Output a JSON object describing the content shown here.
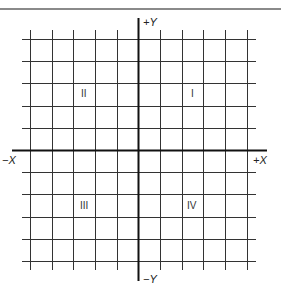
{
  "diagram": {
    "type": "cartesian-coordinate-plane",
    "axes": {
      "x_positive_label": "+X",
      "x_negative_label": "−X",
      "y_positive_label": "+Y",
      "y_negative_label": "−Y"
    },
    "quadrants": [
      {
        "id": "I",
        "label": "I",
        "position": "upper-right"
      },
      {
        "id": "II",
        "label": "II",
        "position": "upper-left"
      },
      {
        "id": "III",
        "label": "III",
        "position": "lower-left"
      },
      {
        "id": "IV",
        "label": "IV",
        "position": "lower-right"
      }
    ],
    "grid": {
      "columns_left_of_y_axis": 5,
      "columns_right_of_y_axis": 5,
      "rows_above_x_axis": 5,
      "rows_below_x_axis": 5
    },
    "colors": {
      "grid_line": "#333333",
      "axis_line": "#111111",
      "top_rule": "#8a8a8a"
    }
  }
}
